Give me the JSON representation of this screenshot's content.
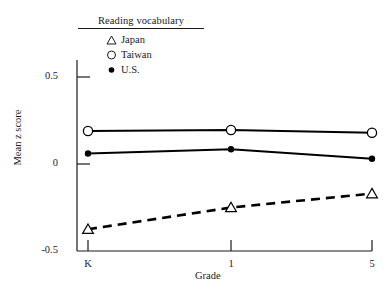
{
  "legend": {
    "title": "Reading vocabulary",
    "entries": [
      {
        "label": "Japan",
        "marker": "open-triangle-icon",
        "color": "#000000"
      },
      {
        "label": "Taiwan",
        "marker": "open-circle-icon",
        "color": "#000000"
      },
      {
        "label": "U.S.",
        "marker": "filled-circle-icon",
        "color": "#000000"
      }
    ]
  },
  "chart_data": {
    "type": "line",
    "title": "Reading vocabulary",
    "xlabel": "Grade",
    "ylabel": "Mean z score",
    "categories": [
      "K",
      "1",
      "5"
    ],
    "x_tick_labels": [
      "K",
      "1",
      "5"
    ],
    "y_tick_labels": [
      "0.5",
      "0",
      "-0.5"
    ],
    "y_ticks": [
      0.5,
      0,
      -0.5
    ],
    "ylim": [
      -0.5,
      0.62
    ],
    "grid": false,
    "legend_position": "top-left-inside",
    "series": [
      {
        "name": "Japan",
        "values": [
          -0.375,
          -0.25,
          -0.17
        ],
        "marker": "open-triangle-icon",
        "line_style": "dashed",
        "color": "#000000"
      },
      {
        "name": "Taiwan",
        "values": [
          0.19,
          0.195,
          0.18
        ],
        "marker": "open-circle-icon",
        "line_style": "solid",
        "color": "#000000"
      },
      {
        "name": "U.S.",
        "values": [
          0.06,
          0.085,
          0.03
        ],
        "marker": "filled-circle-icon",
        "line_style": "solid",
        "color": "#000000"
      }
    ]
  }
}
